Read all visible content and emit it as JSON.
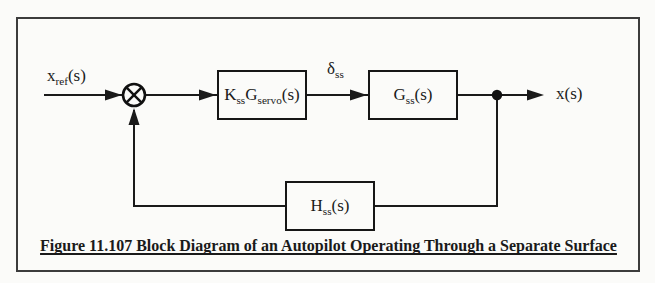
{
  "caption": "Figure 11.107 Block Diagram of an Autopilot Operating Through a Separate Surface",
  "labels": {
    "input": {
      "t1": "x",
      "s1": "ref",
      "t2": "(s)"
    },
    "delta": {
      "t1": "δ",
      "s1": "ss",
      "t2": ""
    },
    "output": {
      "t1": "x(s)"
    }
  },
  "blocks": {
    "servo": {
      "t1": "K",
      "s1": "ss",
      "t2": "G",
      "s2": "servo",
      "t3": "(s)"
    },
    "plant": {
      "t1": "G",
      "s1": "ss",
      "t2": "(s)"
    },
    "feedback": {
      "t1": "H",
      "s1": "ss",
      "t2": "(s)"
    }
  },
  "icons": {
    "summing_junction": "circle-cross-multiply",
    "branch_node": "filled-dot"
  },
  "colors": {
    "line": "#1a1a1a",
    "frame": "#3c3c3c",
    "background": "#fbfbf9"
  }
}
